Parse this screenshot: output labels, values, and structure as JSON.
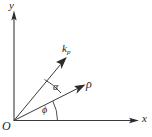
{
  "figure": {
    "type": "vector-diagram",
    "background_color": "#ffffff",
    "stroke_color": "#3a3a3a",
    "text_color": "#1c1c1c",
    "axes": {
      "y_axis_label": "y",
      "x_axis_label": "x",
      "origin_label": "O"
    },
    "vectors": [
      {
        "id": "k-p",
        "label_base": "k",
        "label_subscript": "p",
        "angle_from_x_axis_deg": 55,
        "description": "wave vector k sub p"
      },
      {
        "id": "rho",
        "label_base": "ρ",
        "label_subscript": "",
        "angle_from_x_axis_deg": 27,
        "description": "position vector rho"
      }
    ],
    "angles": [
      {
        "id": "alpha",
        "label": "α",
        "between": "rho and k-p",
        "value_deg": 28
      },
      {
        "id": "phi",
        "label": "ϕ",
        "between": "x-axis and rho",
        "value_deg": 27
      }
    ]
  }
}
